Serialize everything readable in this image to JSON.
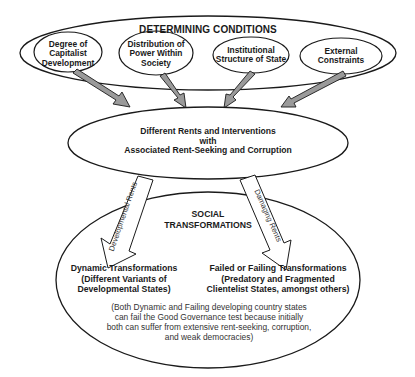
{
  "diagram": {
    "top_group": {
      "title": "DETERMINING CONDITIONS",
      "nodes": [
        {
          "id": "capitalist",
          "lines": [
            "Degree of",
            "Capitalist",
            "Development"
          ]
        },
        {
          "id": "power",
          "lines": [
            "Distribution of",
            "Power Within",
            "Society"
          ]
        },
        {
          "id": "institutional",
          "lines": [
            "Institutional",
            "Structure of State"
          ]
        },
        {
          "id": "external",
          "lines": [
            "External",
            "Constraints"
          ]
        }
      ]
    },
    "middle": {
      "lines": [
        "Different Rents and Interventions",
        "with",
        "Associated Rent-Seeking and Corruption"
      ]
    },
    "arrows": {
      "left_label": "Developmental Rents",
      "right_label": "Damaging Rents"
    },
    "bottom_group": {
      "title_lines": [
        "SOCIAL",
        "TRANSFORMATIONS"
      ],
      "left_outcome": [
        "Dynamic Transformations",
        "(Different Variants of",
        "Developmental States)"
      ],
      "right_outcome": [
        "Failed or Failing Transformations",
        "(Predatory and Fragmented",
        "Clientelist States, amongst others)"
      ],
      "note": [
        "(Both Dynamic and Failing developing country states",
        "can fail the Good Governance test because initially",
        "both can suffer from extensive rent-seeking, corruption,",
        "and weak democracies)"
      ]
    },
    "colors": {
      "stroke": "#1a1a1a",
      "arrow_fill": "#9a9a9a",
      "background": "#ffffff"
    }
  }
}
